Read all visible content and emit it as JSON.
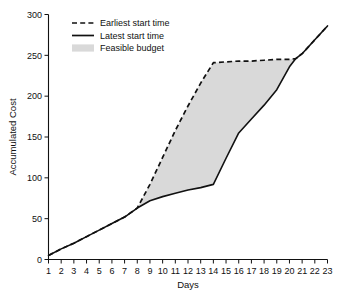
{
  "chart_data": {
    "type": "area",
    "title": "",
    "xlabel": "Days",
    "ylabel": "Accumulated Cost",
    "xlim": [
      1,
      23
    ],
    "ylim": [
      0,
      300
    ],
    "grid": false,
    "legend_position": "top-left",
    "x_ticks": [
      1,
      2,
      3,
      4,
      5,
      6,
      7,
      8,
      9,
      10,
      11,
      12,
      13,
      14,
      15,
      16,
      17,
      18,
      19,
      20,
      21,
      22,
      23
    ],
    "y_ticks": [
      0,
      50,
      100,
      150,
      200,
      250,
      300
    ],
    "colors": {
      "line": "#111111",
      "band_fill": "#d9d9d9",
      "background": "#ffffff"
    },
    "series": [
      {
        "name": "Earliest start time",
        "style": "dashed",
        "x": [
          1,
          2,
          3,
          4,
          5,
          6,
          7,
          8,
          9,
          10,
          11,
          12,
          13,
          14,
          15,
          16,
          17,
          18,
          19,
          20,
          20.5,
          21,
          22,
          23
        ],
        "values": [
          5,
          13,
          20,
          28,
          36,
          44,
          52,
          63,
          92,
          125,
          158,
          188,
          216,
          241,
          242,
          243,
          243,
          244,
          245,
          245,
          246,
          252,
          269,
          286
        ]
      },
      {
        "name": "Latest start time",
        "style": "solid",
        "x": [
          1,
          2,
          3,
          4,
          5,
          6,
          7,
          8,
          9,
          10,
          11,
          12,
          13,
          14,
          15,
          16,
          17,
          18,
          19,
          20,
          20.5,
          21,
          22,
          23
        ],
        "values": [
          5,
          13,
          20,
          28,
          36,
          44,
          52,
          63,
          72,
          77,
          81,
          85,
          88,
          92,
          124,
          155,
          172,
          189,
          208,
          236,
          246,
          252,
          269,
          286
        ]
      }
    ],
    "band": {
      "name": "Feasible budget",
      "fill": "#d9d9d9",
      "upper_series": "Earliest start time",
      "lower_series": "Latest start time",
      "x_start": 8,
      "x_end": 20.5
    }
  },
  "legend": {
    "items": [
      {
        "label": "Earliest start time",
        "marker": "dashed-line"
      },
      {
        "label": "Latest start time",
        "marker": "solid-line"
      },
      {
        "label": "Feasible budget",
        "marker": "gray-swatch"
      }
    ]
  },
  "axes": {
    "x_title": "Days",
    "y_title": "Accumulated Cost"
  }
}
